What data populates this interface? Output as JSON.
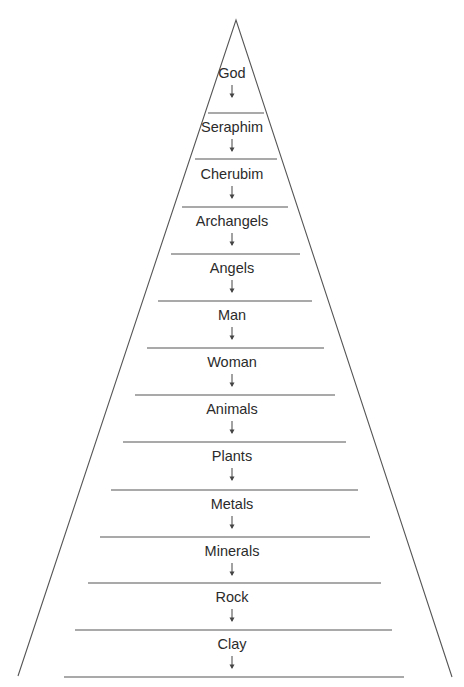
{
  "diagram": {
    "type": "hierarchy-pyramid",
    "direction": "top-down",
    "line_color": "#555555",
    "text_color": "#2b2b2b",
    "levels": [
      {
        "label": "God",
        "top": 64
      },
      {
        "label": "Seraphim",
        "top": 118
      },
      {
        "label": "Cherubim",
        "top": 165
      },
      {
        "label": "Archangels",
        "top": 212
      },
      {
        "label": "Angels",
        "top": 259
      },
      {
        "label": "Man",
        "top": 306
      },
      {
        "label": "Woman",
        "top": 353
      },
      {
        "label": "Animals",
        "top": 400
      },
      {
        "label": "Plants",
        "top": 447
      },
      {
        "label": "Metals",
        "top": 495
      },
      {
        "label": "Minerals",
        "top": 542
      },
      {
        "label": "Rock",
        "top": 588
      },
      {
        "label": "Clay",
        "top": 635
      }
    ],
    "arrow_glyph": "down-arrow"
  }
}
